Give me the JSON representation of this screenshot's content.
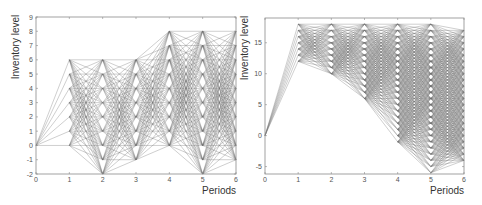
{
  "chart_data": [
    {
      "type": "line",
      "title": "",
      "xlabel": "Periods",
      "ylabel": "Inventory level",
      "xlim": [
        0,
        6
      ],
      "ylim": [
        -2,
        9
      ],
      "xticks": [
        "0",
        "1",
        "2",
        "3",
        "4",
        "5",
        "6"
      ],
      "yticks": [
        "-2",
        "-1",
        "0",
        "1",
        "2",
        "3",
        "4",
        "5",
        "6",
        "7",
        "8",
        "9"
      ],
      "grid": false,
      "legend": null,
      "description": "Scenario tree of feasible inventory transitions between consecutive periods",
      "states_by_period": [
        [
          0
        ],
        [
          0,
          1,
          2,
          3,
          4,
          5,
          6
        ],
        [
          -2,
          -1,
          0,
          1,
          2,
          3,
          4,
          5,
          6
        ],
        [
          -1,
          0,
          1,
          2,
          3,
          4,
          5,
          6
        ],
        [
          0,
          1,
          2,
          3,
          4,
          5,
          6,
          7,
          8
        ],
        [
          -2,
          -1,
          0,
          1,
          2,
          3,
          4,
          5,
          6,
          7,
          8
        ],
        [
          -1,
          0,
          1,
          2,
          3,
          4,
          5,
          6,
          7,
          8
        ]
      ]
    },
    {
      "type": "line",
      "title": "",
      "xlabel": "Periods",
      "ylabel": "Inventory level",
      "xlim": [
        0,
        6
      ],
      "ylim": [
        -6.2,
        19
      ],
      "xticks": [
        "0",
        "1",
        "2",
        "3",
        "4",
        "5",
        "6"
      ],
      "yticks": [
        "-5",
        "0",
        "5",
        "10",
        "15"
      ],
      "grid": false,
      "legend": null,
      "description": "Scenario tree of feasible inventory transitions between consecutive periods",
      "states_by_period": [
        [
          0
        ],
        [
          12,
          13,
          14,
          15,
          16,
          17,
          18
        ],
        [
          10,
          11,
          12,
          13,
          14,
          15,
          16,
          17,
          18
        ],
        [
          6,
          7,
          8,
          9,
          10,
          11,
          12,
          13,
          14,
          15,
          16,
          17,
          18
        ],
        [
          -1,
          0,
          1,
          2,
          3,
          4,
          5,
          6,
          7,
          8,
          9,
          10,
          11,
          12,
          13,
          14,
          15,
          16,
          17,
          18
        ],
        [
          -6,
          -5,
          -4,
          -3,
          -2,
          -1,
          0,
          1,
          2,
          3,
          4,
          5,
          6,
          7,
          8,
          9,
          10,
          11,
          12,
          13,
          14,
          15,
          16,
          17,
          18
        ],
        [
          -4,
          -3,
          -2,
          -1,
          0,
          1,
          2,
          3,
          4,
          5,
          6,
          7,
          8,
          9,
          10,
          11,
          12,
          13,
          14,
          15,
          16,
          17
        ]
      ]
    }
  ],
  "layout": {
    "plots": [
      {
        "left": 36,
        "top": 17,
        "right": 236,
        "bottom": 174,
        "max_jump": 8
      },
      {
        "left": 265,
        "top": 18,
        "right": 464,
        "bottom": 174,
        "max_jump": 7
      }
    ]
  },
  "colors": {
    "edge": "#707070",
    "frame": "#8a8a8a",
    "text": "#333333"
  }
}
